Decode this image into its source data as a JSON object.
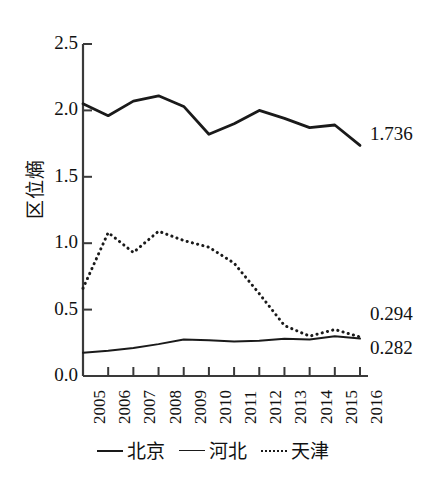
{
  "chart_data": {
    "type": "line",
    "title": "",
    "xlabel": "",
    "ylabel": "区位熵",
    "categories": [
      "2005",
      "2006",
      "2007",
      "2008",
      "2009",
      "2010",
      "2011",
      "2012",
      "2013",
      "2014",
      "2015",
      "2016"
    ],
    "ylim": [
      0.0,
      2.5
    ],
    "yticks": [
      "0.0",
      "0.5",
      "1.0",
      "1.5",
      "2.0",
      "2.5"
    ],
    "ytick_values": [
      0.0,
      0.5,
      1.0,
      1.5,
      2.0,
      2.5
    ],
    "grid": false,
    "legend_position": "bottom",
    "series": [
      {
        "name": "北京",
        "style": "solid-thick",
        "color": "#1a1a1a",
        "values": [
          2.05,
          1.96,
          2.07,
          2.11,
          2.03,
          1.82,
          1.9,
          2.0,
          1.94,
          1.87,
          1.89,
          1.736
        ]
      },
      {
        "name": "河北",
        "style": "solid-thin",
        "color": "#1a1a1a",
        "values": [
          0.175,
          0.19,
          0.21,
          0.24,
          0.275,
          0.27,
          0.26,
          0.265,
          0.28,
          0.275,
          0.3,
          0.282
        ]
      },
      {
        "name": "天津",
        "style": "dotted",
        "color": "#1a1a1a",
        "values": [
          0.66,
          1.08,
          0.93,
          1.09,
          1.02,
          0.97,
          0.85,
          0.62,
          0.38,
          0.3,
          0.35,
          0.294
        ]
      }
    ],
    "annotations": [
      {
        "text": "1.736",
        "series": "北京",
        "x": "2016",
        "y": 1.736
      },
      {
        "text": "0.294",
        "series": "天津",
        "x": "2016",
        "y": 0.294
      },
      {
        "text": "0.282",
        "series": "河北",
        "x": "2016",
        "y": 0.282
      }
    ]
  },
  "legend": {
    "items": [
      {
        "label": "北京",
        "style": "solid-thick"
      },
      {
        "label": "河北",
        "style": "solid-thin"
      },
      {
        "label": "天津",
        "style": "dotted"
      }
    ]
  },
  "axis": {
    "y_title": "区位熵"
  }
}
